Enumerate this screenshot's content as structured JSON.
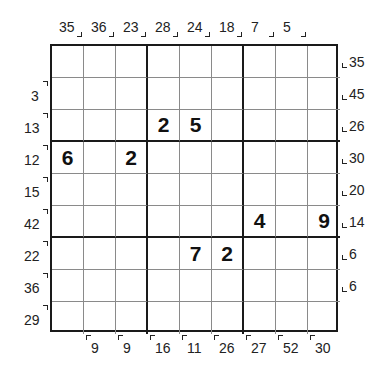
{
  "puzzle": {
    "type": "sudoku-sandwich-outside",
    "grid": [
      [
        "",
        "",
        "",
        "",
        "",
        "",
        "",
        "",
        ""
      ],
      [
        "",
        "",
        "",
        "",
        "",
        "",
        "",
        "",
        ""
      ],
      [
        "",
        "",
        "",
        "2",
        "5",
        "",
        "",
        "",
        ""
      ],
      [
        "6",
        "",
        "2",
        "",
        "",
        "",
        "",
        "",
        ""
      ],
      [
        "",
        "",
        "",
        "",
        "",
        "",
        "",
        "",
        ""
      ],
      [
        "",
        "",
        "",
        "",
        "",
        "",
        "4",
        "",
        "9"
      ],
      [
        "",
        "",
        "",
        "",
        "7",
        "2",
        "",
        "",
        ""
      ],
      [
        "",
        "",
        "",
        "",
        "",
        "",
        "",
        "",
        ""
      ],
      [
        "",
        "",
        "",
        "",
        "",
        "",
        "",
        "",
        ""
      ]
    ],
    "clues_top": [
      "35",
      "36",
      "23",
      "28",
      "24",
      "18",
      "7",
      "5",
      ""
    ],
    "clues_left": [
      "",
      "3",
      "13",
      "12",
      "15",
      "42",
      "22",
      "36",
      "29"
    ],
    "clues_right": [
      "35",
      "45",
      "26",
      "30",
      "20",
      "14",
      "6",
      "6",
      ""
    ],
    "clues_bottom": [
      "",
      "9",
      "9",
      "16",
      "11",
      "26",
      "27",
      "52",
      "30"
    ]
  }
}
